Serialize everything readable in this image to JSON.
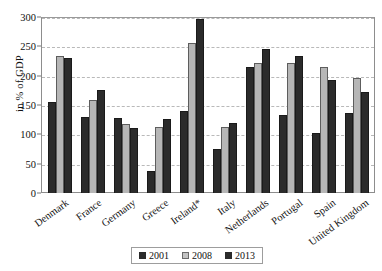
{
  "chart_data": {
    "type": "bar",
    "title": "",
    "xlabel": "",
    "ylabel": "in % of GDP",
    "ylim": [
      0,
      300
    ],
    "yticks": [
      0,
      50,
      100,
      150,
      200,
      250,
      300
    ],
    "grid": true,
    "legend_position": "bottom",
    "categories": [
      "Denmark",
      "France",
      "Germany",
      "Greece",
      "Ireland*",
      "Italy",
      "Netherlands",
      "Portugal",
      "Spain",
      "United Kingdom"
    ],
    "series": [
      {
        "name": "2001",
        "color": "#2b2b2b",
        "values": [
          155,
          130,
          128,
          38,
          140,
          75,
          215,
          133,
          103,
          137
        ]
      },
      {
        "name": "2008",
        "color": "#b6b6b6",
        "values": [
          233,
          158,
          118,
          113,
          255,
          112,
          222,
          222,
          215,
          196
        ]
      },
      {
        "name": "2013",
        "color": "#2b2b2b",
        "values": [
          230,
          176,
          111,
          127,
          297,
          120,
          245,
          233,
          192,
          172
        ]
      }
    ]
  },
  "axis": {
    "y_title": "in % of GDP"
  }
}
